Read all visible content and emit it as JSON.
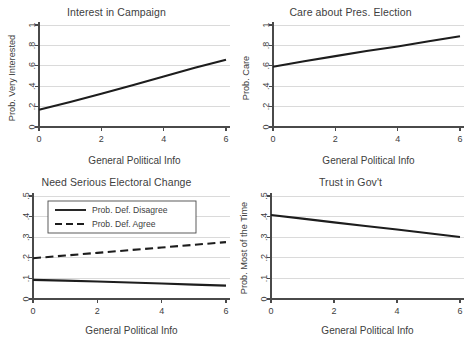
{
  "figure": {
    "name": "four-panel-probability-figure",
    "background_color": "#ffffff",
    "line_color": "#1d1d1d",
    "grid_color": "#d6d6d6",
    "axis_color": "#4a4a4a"
  },
  "shared": {
    "xlabel": "General Political Info",
    "xticks": [
      "0",
      "2",
      "4",
      "6"
    ],
    "xlim": [
      0,
      6
    ]
  },
  "panels": [
    {
      "id": "interest-in-campaign",
      "title": "Interest in Campaign",
      "ylabel": "Prob. Very Interested",
      "yticks": [
        "0",
        ".2",
        ".4",
        ".6",
        ".8",
        "1"
      ]
    },
    {
      "id": "care-about-pres-election",
      "title": "Care about Pres. Election",
      "ylabel": "Prob. Care",
      "yticks": [
        "0",
        ".2",
        ".4",
        ".6",
        ".8",
        "1"
      ]
    },
    {
      "id": "need-serious-electoral-change",
      "title": "Need Serious Electoral Change",
      "ylabel": "",
      "yticks": [
        "0",
        ".1",
        ".2",
        ".3",
        ".4",
        ".5"
      ],
      "legend": [
        {
          "label": "Prob. Def. Disagree",
          "style": "solid"
        },
        {
          "label": "Prob. Def. Agree",
          "style": "dashed"
        }
      ]
    },
    {
      "id": "trust-in-govt",
      "title": "Trust in Gov't",
      "ylabel": "Prob. Most of the Time",
      "yticks": [
        "0",
        ".1",
        ".2",
        ".3",
        ".4",
        ".5"
      ]
    }
  ],
  "chart_data": [
    {
      "type": "line",
      "title": "Interest in Campaign",
      "xlabel": "General Political Info",
      "ylabel": "Prob. Very Interested",
      "xlim": [
        0,
        6
      ],
      "ylim": [
        0,
        1
      ],
      "xticks": [
        0,
        2,
        4,
        6
      ],
      "yticks": [
        0,
        0.2,
        0.4,
        0.6,
        0.8,
        1
      ],
      "grid": true,
      "legend": "none",
      "series": [
        {
          "name": "Prob. Very Interested",
          "style": "solid",
          "x": [
            0,
            1,
            2,
            3,
            4,
            5,
            6
          ],
          "values": [
            0.17,
            0.245,
            0.325,
            0.41,
            0.495,
            0.58,
            0.66
          ]
        }
      ]
    },
    {
      "type": "line",
      "title": "Care about Pres. Election",
      "xlabel": "General Political Info",
      "ylabel": "Prob. Care",
      "xlim": [
        0,
        6
      ],
      "ylim": [
        0,
        1
      ],
      "xticks": [
        0,
        2,
        4,
        6
      ],
      "yticks": [
        0,
        0.2,
        0.4,
        0.6,
        0.8,
        1
      ],
      "grid": true,
      "legend": "none",
      "series": [
        {
          "name": "Prob. Care",
          "style": "solid",
          "x": [
            0,
            1,
            2,
            3,
            4,
            5,
            6
          ],
          "values": [
            0.59,
            0.645,
            0.695,
            0.745,
            0.79,
            0.84,
            0.89
          ]
        }
      ]
    },
    {
      "type": "line",
      "title": "Need Serious Electoral Change",
      "xlabel": "General Political Info",
      "ylabel": "",
      "xlim": [
        0,
        6
      ],
      "ylim": [
        0,
        0.5
      ],
      "xticks": [
        0,
        2,
        4,
        6
      ],
      "yticks": [
        0,
        0.1,
        0.2,
        0.3,
        0.4,
        0.5
      ],
      "grid": true,
      "legend": "inside-top",
      "series": [
        {
          "name": "Prob. Def. Disagree",
          "style": "solid",
          "x": [
            0,
            1,
            2,
            3,
            4,
            5,
            6
          ],
          "values": [
            0.093,
            0.089,
            0.085,
            0.08,
            0.075,
            0.07,
            0.065
          ]
        },
        {
          "name": "Prob. Def. Agree",
          "style": "dashed",
          "x": [
            0,
            1,
            2,
            3,
            4,
            5,
            6
          ],
          "values": [
            0.198,
            0.211,
            0.224,
            0.237,
            0.25,
            0.263,
            0.276
          ]
        }
      ]
    },
    {
      "type": "line",
      "title": "Trust in Gov't",
      "xlabel": "General Political Info",
      "ylabel": "Prob. Most of the Time",
      "xlim": [
        0,
        6
      ],
      "ylim": [
        0,
        0.5
      ],
      "xticks": [
        0,
        2,
        4,
        6
      ],
      "yticks": [
        0,
        0.1,
        0.2,
        0.3,
        0.4,
        0.5
      ],
      "grid": true,
      "legend": "none",
      "series": [
        {
          "name": "Prob. Most of the Time",
          "style": "solid",
          "x": [
            0,
            1,
            2,
            3,
            4,
            5,
            6
          ],
          "values": [
            0.408,
            0.39,
            0.372,
            0.354,
            0.337,
            0.319,
            0.301
          ]
        }
      ]
    }
  ]
}
